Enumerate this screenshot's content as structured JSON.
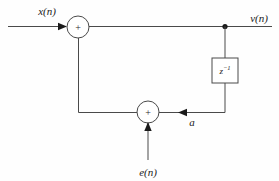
{
  "diagram": {
    "type": "signal-flow-block-diagram",
    "background_color": "#fefefe",
    "line_color": "#4a4a4a",
    "text_color": "#1a1a1a",
    "labels": {
      "input": "x(n)",
      "output": "v(n)",
      "noise_input": "e(n)",
      "feedback": "a",
      "delay_base": "z",
      "delay_exponent": "−1",
      "adder_top_sign": "+",
      "adder_bottom_sign": "+"
    },
    "blocks": [
      {
        "name": "summing-node-top",
        "shape": "circle",
        "cx": 78,
        "cy": 27,
        "r": 11,
        "sign": "+"
      },
      {
        "name": "summing-node-bottom",
        "shape": "circle",
        "cx": 148,
        "cy": 112,
        "r": 11,
        "sign": "+"
      },
      {
        "name": "delay-block",
        "shape": "rect",
        "x": 212,
        "y": 58,
        "width": 26,
        "height": 25,
        "label": "z−1"
      }
    ],
    "junctions": [
      {
        "name": "output-tap",
        "cx": 225,
        "cy": 26,
        "r": 2.6
      }
    ]
  }
}
